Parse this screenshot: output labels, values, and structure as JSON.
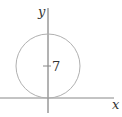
{
  "diagram": {
    "type": "coordinate-plot",
    "axes": {
      "x_label": "x",
      "y_label": "y",
      "color": "#555555"
    },
    "circle": {
      "center_label": "7",
      "description": "circle tangent to x-axis at origin, center on y-axis",
      "stroke": "#aaaaaa"
    }
  }
}
